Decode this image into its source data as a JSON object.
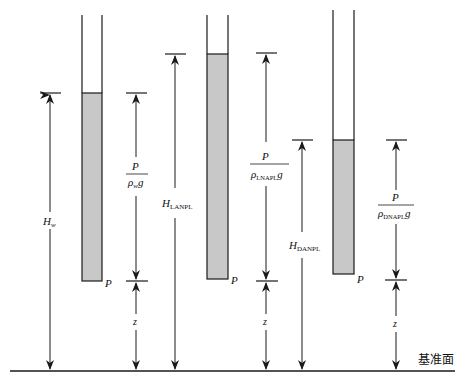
{
  "diagram": {
    "title": "",
    "datum_label": "基准面",
    "tubes": [
      {
        "name": "water",
        "point_label": "P",
        "head_label": {
          "main": "H",
          "sub": "w"
        },
        "pressure_label": {
          "num": "P",
          "den_main": "ρ",
          "den_sub": "w",
          "den_tail": "g"
        },
        "elevation_label": "z"
      },
      {
        "name": "LNAPL",
        "point_label": "P",
        "head_label": {
          "main": "H",
          "sub": "LANPL"
        },
        "pressure_label": {
          "num": "P",
          "den_main": "ρ",
          "den_sub": "LNAPL",
          "den_tail": "g"
        },
        "elevation_label": "z"
      },
      {
        "name": "DNAPL",
        "point_label": "P",
        "head_label": {
          "main": "H",
          "sub": "DANPL"
        },
        "pressure_label": {
          "num": "P",
          "den_main": "ρ",
          "den_sub": "DNAPL",
          "den_tail": "g"
        },
        "elevation_label": "z"
      }
    ],
    "colors": {
      "line": "#1a1a1a",
      "fluid_fill": "#c8c8c8",
      "background": "#ffffff"
    }
  }
}
